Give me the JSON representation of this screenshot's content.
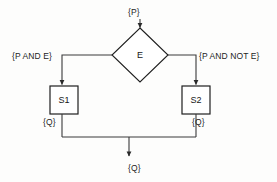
{
  "diagram": {
    "type": "flowchart",
    "canvas": {
      "width": 277,
      "height": 182
    },
    "style": {
      "background": "#fdfdfc",
      "line_color": "#3a3a3a",
      "shape_fill": "#ffffff",
      "shape_stroke": "#1f1f1f",
      "text_color": "#161616"
    },
    "nodes": [
      {
        "id": "decision",
        "shape": "diamond",
        "label": "E",
        "cx": 140,
        "cy": 55,
        "rx": 28,
        "ry": 27
      },
      {
        "id": "s1",
        "shape": "rectangle",
        "label": "S1",
        "x": 50,
        "y": 86,
        "w": 28,
        "h": 28
      },
      {
        "id": "s2",
        "shape": "rectangle",
        "label": "S2",
        "x": 182,
        "y": 86,
        "w": 28,
        "h": 28
      }
    ],
    "assertions": [
      {
        "id": "pre",
        "text": "{P}",
        "attached_to": "entry-arrow"
      },
      {
        "id": "true",
        "text": "{P AND E}",
        "attached_to": "true-branch"
      },
      {
        "id": "false",
        "text": "{P AND NOT E}",
        "attached_to": "false-branch"
      },
      {
        "id": "q-left",
        "text": "{Q}",
        "attached_to": "s1-exit"
      },
      {
        "id": "q-right",
        "text": "{Q}",
        "attached_to": "s2-exit"
      },
      {
        "id": "q-post",
        "text": "{Q}",
        "attached_to": "merge-exit"
      }
    ],
    "edges": [
      {
        "id": "entry",
        "from": "{P}",
        "to": "decision",
        "arrow": true
      },
      {
        "id": "true-branch",
        "from": "decision",
        "to": "s1",
        "arrow": true
      },
      {
        "id": "false-branch",
        "from": "decision",
        "to": "s2",
        "arrow": true
      },
      {
        "id": "s1-merge",
        "from": "s1",
        "to": "merge",
        "arrow": false
      },
      {
        "id": "s2-merge",
        "from": "s2",
        "to": "merge",
        "arrow": false
      },
      {
        "id": "merge-exit",
        "from": "merge",
        "to": "{Q}",
        "arrow": true
      }
    ]
  }
}
